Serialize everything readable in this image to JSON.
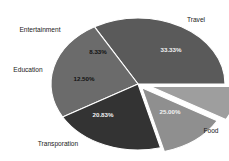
{
  "chart_data": {
    "type": "pie",
    "title": "",
    "subtitle": "",
    "xlabel": "",
    "ylabel": "",
    "legend": "none",
    "grid": false,
    "value_format": "percent",
    "categories": [
      "Travel",
      "Food",
      "Transporation",
      "Education",
      "Entertainment"
    ],
    "values": [
      33.33,
      25.0,
      20.83,
      12.5,
      8.33
    ],
    "labels": [
      "33.33%",
      "25.00%",
      "20.83%",
      "12.50%",
      "8.33%"
    ],
    "colors": [
      "#5a5a5a",
      "#6b6b6b",
      "#333333",
      "#8f8f8f",
      "#9e9e9e"
    ],
    "exploded": [
      false,
      false,
      false,
      true,
      true
    ],
    "slices": [
      {
        "name": "Travel",
        "label": "Travel",
        "percent_label": "33.33%",
        "value": 33.33,
        "color": "#5a5a5a",
        "exploded": false
      },
      {
        "name": "Food",
        "label": "Food",
        "percent_label": "25.00%",
        "value": 25.0,
        "color": "#6b6b6b",
        "exploded": false
      },
      {
        "name": "Transporation",
        "label": "Transporation",
        "percent_label": "20.83%",
        "value": 20.83,
        "color": "#333333",
        "exploded": false
      },
      {
        "name": "Education",
        "label": "Education",
        "percent_label": "12.50%",
        "value": 12.5,
        "color": "#8f8f8f",
        "exploded": true
      },
      {
        "name": "Entertainment",
        "label": "Entertainment",
        "percent_label": "8.33%",
        "value": 8.33,
        "color": "#9e9e9e",
        "exploded": true
      }
    ]
  },
  "geometry": {
    "center_x": 138,
    "center_y": 84,
    "radius_x": 87,
    "radius_y": 66,
    "start_angle_deg": 0,
    "direction": "counterclockwise"
  },
  "category_label_positions": [
    {
      "name": "Travel",
      "x": 196,
      "y": 22,
      "anchor": "middle"
    },
    {
      "name": "Food",
      "x": 211,
      "y": 133,
      "anchor": "middle"
    },
    {
      "name": "Transporation",
      "x": 58,
      "y": 146,
      "anchor": "middle"
    },
    {
      "name": "Education",
      "x": 28,
      "y": 72,
      "anchor": "middle"
    },
    {
      "name": "Entertainment",
      "x": 40,
      "y": 32,
      "anchor": "middle"
    }
  ],
  "percent_label_positions": [
    {
      "name": "Travel",
      "x": 171,
      "y": 52,
      "dark_bg": true
    },
    {
      "name": "Food",
      "x": 170,
      "y": 114,
      "dark_bg": true
    },
    {
      "name": "Transporation",
      "x": 103,
      "y": 117,
      "dark_bg": true
    },
    {
      "name": "Education",
      "x": 84,
      "y": 81,
      "dark_bg": false
    },
    {
      "name": "Entertainment",
      "x": 98,
      "y": 54,
      "dark_bg": false
    }
  ],
  "background_color": "#ffffff",
  "slice_border_color": "#ffffff"
}
